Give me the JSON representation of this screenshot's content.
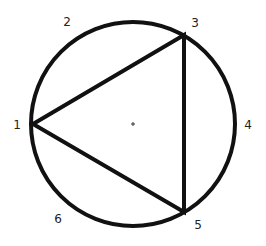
{
  "diagram": {
    "type": "circle-inscribed-triangle",
    "stroke_color": "#111111",
    "circle": {
      "cx": 133,
      "cy": 124,
      "r": 102,
      "stroke_width": 4
    },
    "triangle": {
      "vertices": [
        "1",
        "3",
        "5"
      ],
      "stroke_width": 4
    },
    "center_mark": {
      "x": 133,
      "y": 124,
      "glyph": "+"
    },
    "points": [
      {
        "label": "1",
        "x": 33,
        "y": 124,
        "label_x": 17,
        "label_y": 129
      },
      {
        "label": "2",
        "x": 68,
        "y": 45,
        "label_x": 67,
        "label_y": 26
      },
      {
        "label": "3",
        "x": 184,
        "y": 35,
        "label_x": 195,
        "label_y": 27
      },
      {
        "label": "4",
        "x": 235,
        "y": 124,
        "label_x": 248,
        "label_y": 129
      },
      {
        "label": "5",
        "x": 184,
        "y": 212,
        "label_x": 198,
        "label_y": 229
      },
      {
        "label": "6",
        "x": 65,
        "y": 200,
        "label_x": 58,
        "label_y": 223
      }
    ]
  }
}
